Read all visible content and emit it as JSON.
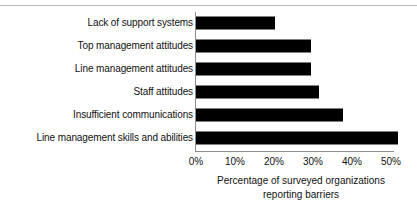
{
  "chart_data": {
    "type": "bar",
    "orientation": "horizontal",
    "title": "",
    "xlabel_line1": "Percentage  of surveyed organizations",
    "xlabel_line2": "reporting barriers",
    "ylabel": "",
    "categories": [
      "Lack of support systems",
      "Top management attitudes",
      "Line management attitudes",
      "Staff attitudes",
      "Insufficient communications",
      "Line management skills and abilities"
    ],
    "values": [
      20,
      29,
      29,
      31,
      37,
      51
    ],
    "xlim": [
      0,
      50
    ],
    "xticks": [
      0,
      10,
      20,
      30,
      40,
      50
    ],
    "xtick_labels": [
      "0%",
      "10%",
      "20%",
      "30%",
      "40%",
      "50%"
    ],
    "grid": false,
    "legend": false,
    "bar_color": "#000000",
    "axis_color": "#8e8e8e",
    "background": "#ffffff"
  }
}
